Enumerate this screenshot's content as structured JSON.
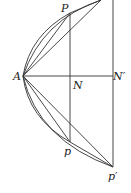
{
  "diagram": {
    "labels": {
      "A": "A",
      "P": "P",
      "N": "N",
      "N_prime": "N′",
      "p": "p",
      "p_prime": "p′"
    },
    "stroke_color": "#333333",
    "background": "#ffffff"
  }
}
